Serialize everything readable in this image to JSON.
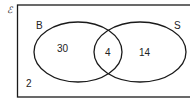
{
  "diagram": {
    "type": "venn",
    "universal_symbol": "ℰ",
    "sets": [
      {
        "label": "B"
      },
      {
        "label": "S"
      }
    ],
    "regions": {
      "only_b": "30",
      "both": "4",
      "only_s": "14",
      "neither": "2"
    },
    "colors": {
      "stroke": "#1a1a1a",
      "text": "#222222",
      "background": "#ffffff"
    }
  }
}
